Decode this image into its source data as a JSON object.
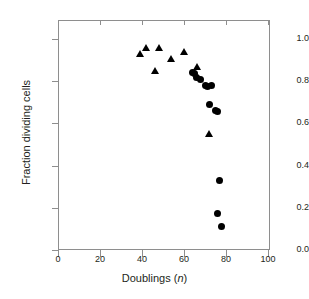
{
  "chart_data": {
    "type": "scatter",
    "title": "",
    "xlabel": "Doublings (n)",
    "xlabel_plain": "Doublings (",
    "xlabel_italic": "n",
    "xlabel_close": ")",
    "ylabel": "Fraction dividing cells",
    "xlim": [
      0,
      110
    ],
    "ylim": [
      0.0,
      1.1
    ],
    "xticks": [
      0,
      20,
      40,
      60,
      80,
      100
    ],
    "xtick_labels": [
      "0",
      "20",
      "40",
      "60",
      "80",
      "100"
    ],
    "yticks": [
      0.0,
      0.2,
      0.4,
      0.6,
      0.8,
      1.0
    ],
    "ytick_labels": [
      "0.0",
      "0.2",
      "0.4",
      "0.6",
      "0.8",
      "1.0"
    ],
    "grid": false,
    "legend": false,
    "marker_color": "#000000",
    "axis_color": "#8e8e8e",
    "series": [
      {
        "name": "triangles",
        "marker": "triangle",
        "x": [
          39,
          42,
          46,
          48,
          54,
          60,
          66,
          72
        ],
        "y": [
          0.93,
          0.96,
          0.85,
          0.96,
          0.91,
          0.94,
          0.87,
          0.55
        ]
      },
      {
        "name": "circles",
        "marker": "circle",
        "x": [
          64,
          65,
          66,
          68,
          70,
          71,
          73,
          72,
          75,
          76,
          77,
          76,
          78
        ],
        "y": [
          0.84,
          0.835,
          0.82,
          0.81,
          0.78,
          0.775,
          0.78,
          0.69,
          0.66,
          0.655,
          0.33,
          0.175,
          0.11
        ]
      }
    ]
  }
}
